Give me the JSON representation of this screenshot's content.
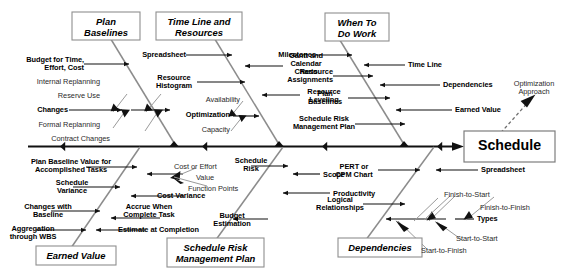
{
  "diagram": {
    "type": "fishbone-ishikawa",
    "effect": {
      "label": "Schedule",
      "optimization_note": "Optimization\nApproach"
    },
    "categories": [
      {
        "id": "plan-baselines",
        "label": "Plan\nBaselines",
        "position": "upper-left",
        "causes": [
          "Budget for Time,\nEffort, Cost",
          "Internal Replanning",
          "Reserve Use",
          "Changes",
          "Formal Replanning",
          "Contract Changes"
        ]
      },
      {
        "id": "time-line-and-resources",
        "label": "Time Line and\nResources",
        "position": "upper-left-center",
        "causes": [
          "Spreadsheet",
          "Gantt and\nCalendar\nCharts",
          "Resource\nHistogram",
          "Resource\nLeveling",
          "Availability",
          "Optimization",
          "Capacity"
        ]
      },
      {
        "id": "when-to-do-work",
        "label": "When To\nDo Work",
        "position": "upper-right",
        "causes": [
          "Milestones",
          "Time Line",
          "Resource\nAssignments",
          "Dependencies",
          "Plan\nBaselines",
          "Earned Value",
          "Schedule Risk\nManagement Plan"
        ]
      },
      {
        "id": "earned-value",
        "label": "Earned Value",
        "position": "lower-left",
        "causes": [
          "Plan Baseline Value for\nAccomplished Tasks",
          "Cost or Effort",
          "Value",
          "Function Points",
          "Schedule\nVariance",
          "Cost Variance",
          "Changes with\nBaseline",
          "Accrue When\nComplete Task",
          "Aggregation\nthrough WBS",
          "Estimate at Completion"
        ]
      },
      {
        "id": "schedule-risk-management-plan",
        "label": "Schedule Risk\nManagement Plan",
        "position": "lower-center",
        "causes": [
          "Schedule\nRisk",
          "Scope",
          "Productivity",
          "Budget\nEstimation"
        ]
      },
      {
        "id": "dependencies",
        "label": "Dependencies",
        "position": "lower-right",
        "causes": [
          "PERT or\nCPM Chart",
          "Spreadsheet",
          "Logical\nRelationships",
          "Types",
          "Finish-to-Start",
          "Finish-to-Finish",
          "Start-to-Start",
          "Start-to-Finish"
        ]
      }
    ],
    "labels": {
      "plan_baselines_box": "Plan\nBaselines",
      "time_line_resources_box": "Time Line and\nResources",
      "when_to_do_work_box": "When To\nDo Work",
      "earned_value_box": "Earned Value",
      "schedule_risk_box": "Schedule Risk\nManagement Plan",
      "dependencies_box": "Dependencies",
      "schedule_head": "Schedule",
      "optimization_approach": "Optimization\nApproach",
      "budget_for_time": "Budget for Time,\nEffort, Cost",
      "internal_replanning": "Internal Replanning",
      "reserve_use": "Reserve Use",
      "changes": "Changes",
      "formal_replanning": "Formal Replanning",
      "contract_changes": "Contract Changes",
      "spreadsheet_top": "Spreadsheet",
      "gantt_calendar_charts": "Gantt and\nCalendar\nCharts",
      "resource_histogram": "Resource\nHistogram",
      "resource_leveling": "Resource\nLeveling",
      "availability": "Availability",
      "optimization": "Optimization",
      "capacity": "Capacity",
      "milestones": "Milestones",
      "time_line": "Time Line",
      "resource_assignments": "Resource\nAssignments",
      "dependencies_cause": "Dependencies",
      "plan_baselines_cause": "Plan\nBaselines",
      "earned_value_cause": "Earned Value",
      "schedule_risk_mgmt_cause": "Schedule Risk\nManagement Plan",
      "plan_baseline_value": "Plan Baseline Value for\nAccomplished Tasks",
      "cost_or_effort": "Cost or Effort",
      "value": "Value",
      "function_points": "Function Points",
      "schedule_variance": "Schedule\nVariance",
      "cost_variance": "Cost Variance",
      "changes_with_baseline": "Changes with\nBaseline",
      "accrue_when_complete": "Accrue When\nComplete Task",
      "aggregation_wbs": "Aggregation\nthrough WBS",
      "estimate_at_completion": "Estimate at Completion",
      "schedule_risk_cause": "Schedule\nRisk",
      "scope": "Scope",
      "productivity": "Productivity",
      "budget_estimation": "Budget\nEstimation",
      "pert_cpm_chart": "PERT or\nCPM Chart",
      "spreadsheet_bottom": "Spreadsheet",
      "logical_relationships": "Logical\nRelationships",
      "types": "Types",
      "finish_to_start": "Finish-to-Start",
      "finish_to_finish": "Finish-to-Finish",
      "start_to_start": "Start-to-Start",
      "start_to_finish": "Start-to-Finish"
    },
    "colors": {
      "spine": "#111111",
      "category_bone": "#8c8c8c",
      "sub_bone": "#111111",
      "thin_connector": "#9a9a9a",
      "box_border": "#8f8f8f",
      "background": "#ffffff",
      "text": "#000000"
    }
  }
}
